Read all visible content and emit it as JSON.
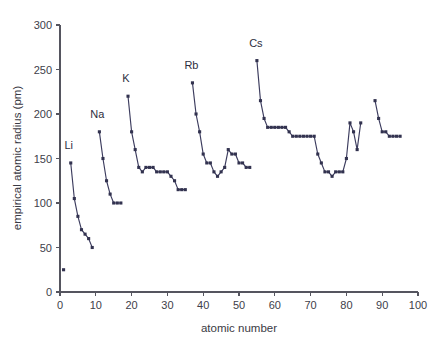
{
  "chart_data": {
    "type": "line",
    "title": "",
    "xlabel": "atomic number",
    "ylabel": "empirical atomic radius (pm)",
    "xlim": [
      0,
      100
    ],
    "ylim": [
      0,
      300
    ],
    "xticks": [
      0,
      10,
      20,
      30,
      40,
      50,
      60,
      70,
      80,
      90,
      100
    ],
    "yticks": [
      0,
      50,
      100,
      150,
      200,
      250,
      300
    ],
    "grid": false,
    "legend": null,
    "marker": "square",
    "line_color": "#3c3c5e",
    "marker_color": "#32324f",
    "annotations": [
      {
        "text": "Li",
        "x": 3,
        "y": 145,
        "dx": -2,
        "dy": -14
      },
      {
        "text": "Na",
        "x": 11,
        "y": 180,
        "dx": -2,
        "dy": -14
      },
      {
        "text": "K",
        "x": 19,
        "y": 220,
        "dx": -2,
        "dy": -14
      },
      {
        "text": "Rb",
        "x": 37,
        "y": 235,
        "dx": -1,
        "dy": -14
      },
      {
        "text": "Cs",
        "x": 55,
        "y": 260,
        "dx": -1,
        "dy": -14
      }
    ],
    "series": [
      {
        "name": "hydrogen",
        "connected": false,
        "x": [
          1
        ],
        "y": [
          25
        ]
      },
      {
        "name": "period-2",
        "connected": true,
        "x": [
          3,
          4,
          5,
          6,
          7,
          8,
          9
        ],
        "y": [
          145,
          105,
          85,
          70,
          65,
          60,
          50
        ]
      },
      {
        "name": "period-3",
        "connected": true,
        "x": [
          11,
          12,
          13,
          14,
          15,
          16,
          17
        ],
        "y": [
          180,
          150,
          125,
          110,
          100,
          100,
          100
        ]
      },
      {
        "name": "period-4",
        "connected": true,
        "x": [
          19,
          20,
          21,
          22,
          23,
          24,
          25,
          26,
          27,
          28,
          29,
          30,
          31,
          32,
          33,
          34,
          35
        ],
        "y": [
          220,
          180,
          160,
          140,
          135,
          140,
          140,
          140,
          135,
          135,
          135,
          135,
          130,
          125,
          115,
          115,
          115
        ]
      },
      {
        "name": "period-5",
        "connected": true,
        "x": [
          37,
          38,
          39,
          40,
          41,
          42,
          43,
          44,
          45,
          46,
          47,
          48,
          49,
          50,
          51,
          52,
          53
        ],
        "y": [
          235,
          200,
          180,
          155,
          145,
          145,
          135,
          130,
          135,
          140,
          160,
          155,
          155,
          145,
          145,
          140,
          140
        ]
      },
      {
        "name": "period-6",
        "connected": true,
        "x": [
          55,
          56,
          57,
          58,
          59,
          60,
          61,
          62,
          63,
          64,
          65,
          66,
          67,
          68,
          69,
          70,
          71,
          72,
          73,
          74,
          75,
          76,
          77,
          78,
          79,
          80,
          81,
          82,
          83,
          84
        ],
        "y": [
          260,
          215,
          195,
          185,
          185,
          185,
          185,
          185,
          185,
          180,
          175,
          175,
          175,
          175,
          175,
          175,
          175,
          155,
          145,
          135,
          135,
          130,
          135,
          135,
          135,
          150,
          190,
          180,
          160,
          190
        ]
      },
      {
        "name": "period-7",
        "connected": true,
        "x": [
          88,
          89,
          90,
          91,
          92,
          93,
          94,
          95
        ],
        "y": [
          215,
          195,
          180,
          180,
          175,
          175,
          175,
          175
        ]
      }
    ]
  },
  "layout": {
    "plot_left_px": 60,
    "plot_right_px": 418,
    "plot_top_px": 25,
    "plot_bottom_px": 292
  }
}
